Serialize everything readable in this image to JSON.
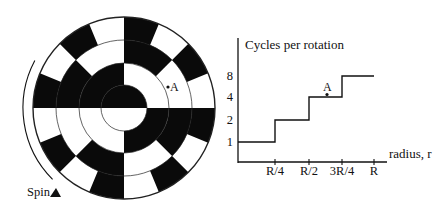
{
  "disk": {
    "center": [
      124,
      108
    ],
    "outer_radius": 91,
    "ring_boundaries": [
      23,
      45,
      68,
      91
    ],
    "rings": [
      {
        "name": "ring-1",
        "inner": 0,
        "outer": 23,
        "cycles": 1,
        "black_start_deg": 0
      },
      {
        "name": "ring-2",
        "inner": 23,
        "outer": 45,
        "cycles": 2,
        "black_start_deg": 90
      },
      {
        "name": "ring-3",
        "inner": 45,
        "outer": 68,
        "cycles": 4,
        "black_start_deg": 45
      },
      {
        "name": "ring-4",
        "inner": 68,
        "outer": 91,
        "cycles": 8,
        "black_start_deg": 22.5
      }
    ],
    "point_a": {
      "label": "A",
      "x": 168,
      "y": 87
    },
    "spin": {
      "label": "Spin",
      "arc_radius": 101,
      "arc_start_deg": 152,
      "arc_end_deg": 225
    }
  },
  "chart_data": {
    "type": "line",
    "step": true,
    "title": "",
    "ylabel": "Cycles per rotation",
    "xlabel": "radius, r",
    "x_ticks": [
      "R/4",
      "R/2",
      "3R/4",
      "R"
    ],
    "y_ticks": [
      "1",
      "2",
      "4",
      "8"
    ],
    "y_scale": "log2",
    "series": [
      {
        "name": "cycles",
        "points": [
          {
            "x": 0,
            "y": 1
          },
          {
            "x": 0.25,
            "y": 1
          },
          {
            "x": 0.25,
            "y": 2
          },
          {
            "x": 0.5,
            "y": 2
          },
          {
            "x": 0.5,
            "y": 4
          },
          {
            "x": 0.75,
            "y": 4
          },
          {
            "x": 0.75,
            "y": 8
          },
          {
            "x": 1.0,
            "y": 8
          }
        ]
      }
    ],
    "annotations": [
      {
        "label": "A",
        "x": 0.625,
        "y": 4
      }
    ],
    "grid": false,
    "legend": false
  },
  "plot_layout": {
    "origin": [
      238,
      162
    ],
    "y_axis_top": 38,
    "x_axis_end": 387,
    "x_tick_px": [
      275,
      309,
      342,
      374
    ],
    "y_tick_px": [
      142,
      120,
      97,
      76
    ]
  }
}
